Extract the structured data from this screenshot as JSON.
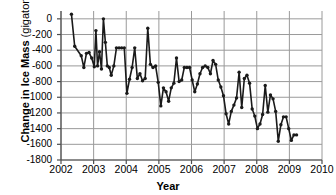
{
  "chart_data": {
    "type": "line",
    "title": "",
    "xlabel": "Year",
    "ylabel": "Change in Ice Mass (gigatons)",
    "ylabel_main": "Change in Ice Mass",
    "ylabel_unit": "(gigatons)",
    "xlim": [
      2002,
      2010
    ],
    "ylim": [
      -1800,
      100
    ],
    "yticks": [
      0,
      -200,
      -400,
      -600,
      -800,
      -1000,
      -1200,
      -1400,
      -1600,
      -1800
    ],
    "ytick_labels": [
      "0",
      "-200",
      "-400",
      "-600",
      "-800",
      "-1000",
      "-1200",
      "-1400",
      "-1600",
      "-1800"
    ],
    "xticks": [
      2002,
      2003,
      2004,
      2005,
      2006,
      2007,
      2008,
      2009,
      2010
    ],
    "xtick_labels": [
      "2002",
      "2003",
      "2004",
      "2005",
      "2006",
      "2007",
      "2008",
      "2009",
      "2010"
    ],
    "grid": "horizontal-and-vertical",
    "legend": "none",
    "marker": "filled-circle",
    "line_color": "#1a1a1a",
    "grid_color": "#9a9a9a",
    "axis_color": "#4d4d4d",
    "series": [
      {
        "name": "Change in Ice Mass",
        "x": [
          2002.32,
          2002.42,
          2002.62,
          2002.7,
          2002.78,
          2002.86,
          2002.94,
          2003.02,
          2003.07,
          2003.12,
          2003.18,
          2003.24,
          2003.3,
          2003.36,
          2003.42,
          2003.48,
          2003.54,
          2003.62,
          2003.7,
          2003.78,
          2003.86,
          2003.94,
          2004.02,
          2004.1,
          2004.18,
          2004.26,
          2004.34,
          2004.42,
          2004.5,
          2004.58,
          2004.66,
          2004.74,
          2004.82,
          2004.9,
          2004.98,
          2005.06,
          2005.14,
          2005.22,
          2005.3,
          2005.38,
          2005.46,
          2005.54,
          2005.62,
          2005.7,
          2005.78,
          2005.86,
          2005.94,
          2006.02,
          2006.1,
          2006.18,
          2006.26,
          2006.34,
          2006.42,
          2006.5,
          2006.58,
          2006.66,
          2006.74,
          2006.82,
          2006.9,
          2006.98,
          2007.06,
          2007.14,
          2007.22,
          2007.3,
          2007.38,
          2007.46,
          2007.54,
          2007.62,
          2007.7,
          2007.78,
          2007.86,
          2007.94,
          2008.02,
          2008.1,
          2008.18,
          2008.26,
          2008.34,
          2008.42,
          2008.5,
          2008.58,
          2008.66,
          2008.74,
          2008.82,
          2008.9,
          2008.98,
          2009.06,
          2009.14,
          2009.22
        ],
        "values": [
          60,
          -350,
          -470,
          -620,
          -440,
          -430,
          -500,
          -610,
          -150,
          -600,
          -420,
          -640,
          0,
          -300,
          -600,
          -620,
          -720,
          -600,
          -370,
          -370,
          -370,
          -370,
          -950,
          -770,
          -620,
          -370,
          -760,
          -700,
          -790,
          -760,
          -120,
          -580,
          -620,
          -600,
          -810,
          -1110,
          -880,
          -930,
          -1050,
          -880,
          -820,
          -500,
          -800,
          -780,
          -620,
          -620,
          -620,
          -780,
          -930,
          -830,
          -700,
          -620,
          -600,
          -620,
          -700,
          -530,
          -580,
          -780,
          -870,
          -980,
          -1210,
          -1340,
          -1180,
          -1100,
          -1010,
          -680,
          -1130,
          -760,
          -720,
          -820,
          -1150,
          -1240,
          -1400,
          -1340,
          -1220,
          -850,
          -1190,
          -970,
          -1020,
          -1180,
          -1560,
          -1350,
          -1250,
          -1250,
          -1400,
          -1550,
          -1480,
          -1480
        ]
      }
    ]
  },
  "axis": {
    "y_label_main": "Change in Ice Mass",
    "y_label_unit": "(gigatons)",
    "x_label": "Year"
  }
}
